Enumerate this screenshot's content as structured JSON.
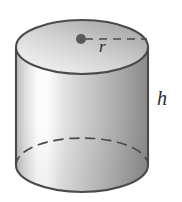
{
  "figure": {
    "name": "cylinder-diagram",
    "shape": "cylinder",
    "background_color": "#ffffff",
    "outline_color": "#4a4a4a",
    "surface_light_color": "#fdfdfd",
    "surface_mid_color": "#c8c8c8",
    "surface_dark_color": "#8d8d8d",
    "top_face_light_color": "#efefef",
    "top_face_dark_color": "#a8a8a8",
    "center_point_color": "#5a5a5a",
    "dash_color": "#4a4a4a",
    "labels": {
      "radius": "r",
      "height": "h"
    },
    "geometry": {
      "left_x": 16,
      "right_x": 148,
      "top_ellipse_center_y": 47,
      "bottom_ellipse_center_y": 165,
      "ellipse_rx": 66,
      "ellipse_ry": 27,
      "center_dot_x": 81,
      "center_dot_y": 39,
      "center_dot_radius": 5
    }
  }
}
